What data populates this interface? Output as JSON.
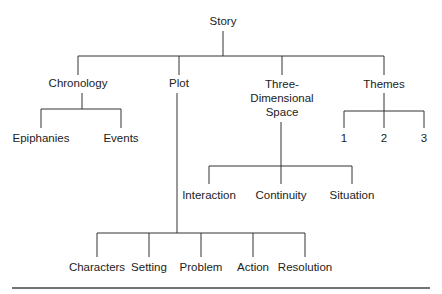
{
  "diagram": {
    "root": {
      "label": "Story"
    },
    "level1": [
      {
        "label": "Chronology"
      },
      {
        "label": "Plot"
      },
      {
        "label_lines": [
          "Three-",
          "Dimensional",
          "Space"
        ]
      },
      {
        "label": "Themes"
      }
    ],
    "chronology_children": [
      "Epiphanies",
      "Events"
    ],
    "themes_children": [
      "1",
      "2",
      "3"
    ],
    "space_children": [
      "Interaction",
      "Continuity",
      "Situation"
    ],
    "plot_children": [
      "Characters",
      "Setting",
      "Problem",
      "Action",
      "Resolution"
    ]
  },
  "colors": {
    "line": "#333333",
    "text": "#222222",
    "background": "#ffffff"
  }
}
